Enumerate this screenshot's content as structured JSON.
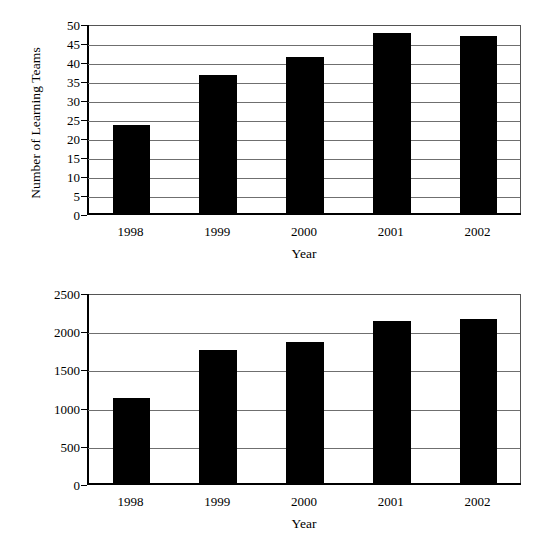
{
  "chart_data": [
    {
      "type": "bar",
      "title": "",
      "xlabel": "Year",
      "ylabel": "Number of Learning Teams",
      "categories": [
        "1998",
        "1999",
        "2000",
        "2001",
        "2002"
      ],
      "values": [
        23.5,
        36.5,
        41.3,
        47.6,
        46.8
      ],
      "ylim": [
        0,
        50
      ],
      "yticks": [
        "0",
        "5",
        "10",
        "15",
        "20",
        "25",
        "30",
        "35",
        "40",
        "45",
        "50"
      ],
      "ytick_values": [
        0,
        5,
        10,
        15,
        20,
        25,
        30,
        35,
        40,
        45,
        50
      ],
      "grid": true,
      "legend": false,
      "bar_color": "#000000",
      "gridline_color": "#6f6f6f"
    },
    {
      "type": "bar",
      "title": "",
      "xlabel": "Year",
      "ylabel": "Number of Students",
      "categories": [
        "1998",
        "1999",
        "2000",
        "2001",
        "2002"
      ],
      "values": [
        1120,
        1760,
        1865,
        2140,
        2165
      ],
      "ylim": [
        0,
        2500
      ],
      "yticks": [
        "0",
        "500",
        "1000",
        "1500",
        "2000",
        "2500"
      ],
      "ytick_values": [
        0,
        500,
        1000,
        1500,
        2000,
        2500
      ],
      "grid": true,
      "legend": false,
      "bar_color": "#000000",
      "gridline_color": "#6f6f6f"
    }
  ]
}
